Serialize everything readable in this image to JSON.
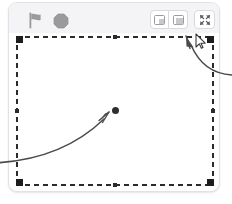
{
  "app": {
    "name": "scratch-stage-panel",
    "background": "#ffffff",
    "panel_bg": "#ffffff",
    "header_bg": "#f4f4f6",
    "border_color": "#e2e2e4",
    "selection_color": "#2b2b2b",
    "annotation_color": "#4a4a4a"
  },
  "toolbar": {
    "green_flag": {
      "name": "green-flag-button",
      "label": "Go",
      "state": "disabled",
      "color": "#9a9a9a"
    },
    "stop": {
      "name": "stop-button",
      "label": "Stop",
      "state": "disabled",
      "color": "#9a9a9a"
    },
    "small_stage": {
      "name": "small-stage-button",
      "label": "Small stage layout",
      "state": "inactive"
    },
    "large_stage": {
      "name": "large-stage-button",
      "label": "Large stage layout",
      "state": "active"
    },
    "fullscreen": {
      "name": "fullscreen-button",
      "label": "Full screen control",
      "state": "inactive"
    }
  },
  "stage": {
    "name": "stage-canvas",
    "selected": true,
    "sprite": {
      "name": "sprite-dot",
      "shape": "circle",
      "color": "#2e2e2e",
      "x": 112,
      "y": 107
    },
    "handles": [
      {
        "pos": "top-left"
      },
      {
        "pos": "top-center"
      },
      {
        "pos": "top-right"
      },
      {
        "pos": "middle-left"
      },
      {
        "pos": "middle-right"
      },
      {
        "pos": "bottom-left"
      },
      {
        "pos": "bottom-center"
      },
      {
        "pos": "bottom-right"
      }
    ]
  },
  "annotations": [
    {
      "name": "annotation-arrow-to-fullscreen",
      "target": "fullscreen-button",
      "direction": "from-right-edge-curving-up-left",
      "color": "#4a4a4a"
    },
    {
      "name": "annotation-arrow-to-sprite",
      "target": "sprite-dot",
      "direction": "from-left-edge-curving-up-right",
      "color": "#4a4a4a"
    }
  ],
  "cursor": {
    "name": "mouse-cursor",
    "type": "arrow",
    "x": 196,
    "y": 36
  }
}
